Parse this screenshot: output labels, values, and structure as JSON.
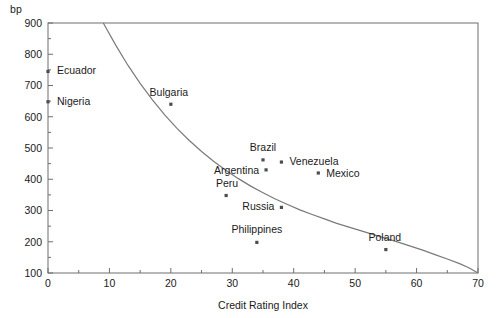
{
  "chart_data": {
    "type": "scatter",
    "title": "",
    "xlabel": "Credit Rating Index",
    "ylabel": "bp",
    "xlim": [
      0,
      70
    ],
    "ylim": [
      100,
      900
    ],
    "grid": false,
    "legend": "none",
    "xticks": [
      0,
      10,
      20,
      30,
      40,
      50,
      60,
      70
    ],
    "xtick_labels": [
      "0",
      "10",
      "20",
      "30",
      "40",
      "50",
      "60",
      "70"
    ],
    "xminor_step": 5,
    "yticks": [
      100,
      200,
      300,
      400,
      500,
      600,
      700,
      800,
      900
    ],
    "ytick_labels": [
      "100",
      "200",
      "300",
      "400",
      "500",
      "600",
      "700",
      "800",
      "900"
    ],
    "yminor_step": 50,
    "points": [
      {
        "name": "Ecuador",
        "x": 0,
        "y": 745,
        "label_dx": 9,
        "label_dy": 3,
        "anchor": "start"
      },
      {
        "name": "Nigeria",
        "x": 0,
        "y": 648,
        "label_dx": 9,
        "label_dy": 3,
        "anchor": "start"
      },
      {
        "name": "Bulgaria",
        "x": 20,
        "y": 640,
        "label_dx": -2,
        "label_dy": -8,
        "anchor": "middle"
      },
      {
        "name": "Peru",
        "x": 29,
        "y": 348,
        "label_dx": 1,
        "label_dy": -9,
        "anchor": "middle"
      },
      {
        "name": "Brazil",
        "x": 35,
        "y": 462,
        "label_dx": 0,
        "label_dy": -9,
        "anchor": "middle"
      },
      {
        "name": "Venezuela",
        "x": 38,
        "y": 455,
        "label_dx": 8,
        "label_dy": 3,
        "anchor": "start"
      },
      {
        "name": "Argentina",
        "x": 35.5,
        "y": 430,
        "label_dx": -7,
        "label_dy": 4,
        "anchor": "end"
      },
      {
        "name": "Mexico",
        "x": 44,
        "y": 420,
        "label_dx": 8,
        "label_dy": 4,
        "anchor": "start"
      },
      {
        "name": "Russia",
        "x": 38,
        "y": 310,
        "label_dx": -7,
        "label_dy": 3,
        "anchor": "end"
      },
      {
        "name": "Philippines",
        "x": 34,
        "y": 198,
        "label_dx": 0,
        "label_dy": -9,
        "anchor": "middle"
      },
      {
        "name": "Poland",
        "x": 55,
        "y": 175,
        "label_dx": -1,
        "label_dy": -9,
        "anchor": "middle"
      }
    ],
    "fit_curve": {
      "description": "fitted exponential decay of spread versus credit rating index",
      "x_start": 9,
      "x_end": 70,
      "y_start": 900,
      "y_end": 100,
      "samples": [
        {
          "x": 9,
          "y": 900
        },
        {
          "x": 11,
          "y": 830
        },
        {
          "x": 13,
          "y": 765
        },
        {
          "x": 15,
          "y": 707
        },
        {
          "x": 17,
          "y": 654
        },
        {
          "x": 19,
          "y": 606
        },
        {
          "x": 21,
          "y": 563
        },
        {
          "x": 23,
          "y": 524
        },
        {
          "x": 25,
          "y": 489
        },
        {
          "x": 27,
          "y": 457
        },
        {
          "x": 29,
          "y": 428
        },
        {
          "x": 31,
          "y": 402
        },
        {
          "x": 33,
          "y": 378
        },
        {
          "x": 35,
          "y": 357
        },
        {
          "x": 37,
          "y": 337
        },
        {
          "x": 39,
          "y": 319
        },
        {
          "x": 41,
          "y": 302
        },
        {
          "x": 43,
          "y": 287
        },
        {
          "x": 45,
          "y": 273
        },
        {
          "x": 47,
          "y": 259
        },
        {
          "x": 49,
          "y": 247
        },
        {
          "x": 51,
          "y": 235
        },
        {
          "x": 53,
          "y": 223
        },
        {
          "x": 55,
          "y": 211
        },
        {
          "x": 57,
          "y": 199
        },
        {
          "x": 59,
          "y": 186
        },
        {
          "x": 61,
          "y": 173
        },
        {
          "x": 63,
          "y": 159
        },
        {
          "x": 65,
          "y": 145
        },
        {
          "x": 67,
          "y": 130
        },
        {
          "x": 68.5,
          "y": 117
        },
        {
          "x": 70,
          "y": 100
        }
      ]
    }
  }
}
